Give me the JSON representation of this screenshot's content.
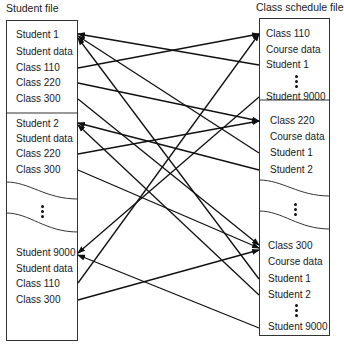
{
  "left_file": {
    "title": "Student file",
    "groups": [
      {
        "items": [
          "Student 1",
          "Student data",
          "Class 110",
          "Class 220",
          "Class 300"
        ]
      },
      {
        "items": [
          "Student 2",
          "Student data",
          "Class 220",
          "Class 300"
        ]
      },
      {
        "items": [
          "Student 9000",
          "Student data",
          "Class 110",
          "Class 300"
        ]
      }
    ]
  },
  "right_file": {
    "title": "Class schedule file",
    "groups": [
      {
        "items": [
          "Class 110",
          "Course data",
          "Student 1",
          "Student 9000"
        ]
      },
      {
        "items": [
          "Class 220",
          "Course data",
          "Student 1",
          "Student 2"
        ]
      },
      {
        "items": [
          "Class 300",
          "Course data",
          "Student 1",
          "Student 2",
          "Student 9000"
        ]
      }
    ]
  },
  "links": [
    {
      "from": "Student 1 / Class 110",
      "to": "Class 110"
    },
    {
      "from": "Student 1 / Class 220",
      "to": "Class 220"
    },
    {
      "from": "Student 1 / Class 300",
      "to": "Class 300"
    },
    {
      "from": "Student 2 / Class 220",
      "to": "Class 220"
    },
    {
      "from": "Student 2 / Class 300",
      "to": "Class 300"
    },
    {
      "from": "Student 9000 / Class 110",
      "to": "Class 110"
    },
    {
      "from": "Student 9000 / Class 300",
      "to": "Class 300"
    },
    {
      "from": "Class 110 / Student 1",
      "to": "Student 1"
    },
    {
      "from": "Class 110 / Student 9000",
      "to": "Student 9000"
    },
    {
      "from": "Class 220 / Student 1",
      "to": "Student 1"
    },
    {
      "from": "Class 220 / Student 2",
      "to": "Student 2"
    },
    {
      "from": "Class 300 / Student 1",
      "to": "Student 1"
    },
    {
      "from": "Class 300 / Student 2",
      "to": "Student 2"
    },
    {
      "from": "Class 300 / Student 9000",
      "to": "Student 9000"
    }
  ]
}
